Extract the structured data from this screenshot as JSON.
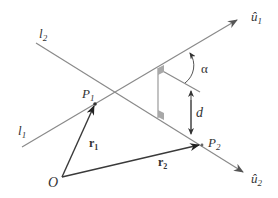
{
  "diagram": {
    "labels": {
      "line2": "l",
      "line2_sub": "2",
      "line1": "l",
      "line1_sub": "1",
      "unit1_base": "û",
      "unit1_sub": "1",
      "unit2_base": "û",
      "unit2_sub": "2",
      "point1": "P",
      "point1_sub": "1",
      "point2": "P",
      "point2_sub": "2",
      "origin": "O",
      "vector1": "r",
      "vector1_sub": "1",
      "vector2": "r",
      "vector2_sub": "2",
      "angle": "α",
      "distance": "d"
    },
    "colors": {
      "line": "#8a8a8a",
      "vector": "#3a3a3a",
      "arrowhead": "#555555",
      "right_angle_fill": "#a8a8a8",
      "text": "#333333"
    }
  }
}
